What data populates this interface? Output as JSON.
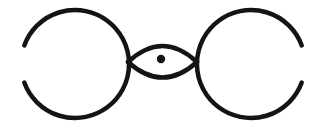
{
  "figure": {
    "canvas": {
      "width": 329,
      "height": 133,
      "background_color": "#ffffff"
    },
    "ink": {
      "color": "#141414",
      "stroke_width": 4.5,
      "style": "hand-drawn"
    },
    "shapes": [
      {
        "name": "left-circle-arc",
        "type": "arc",
        "center_x": 75,
        "center_y": 64,
        "radius": 54,
        "start_angle_deg": 200,
        "end_angle_deg": 160,
        "gap_side": "left",
        "path": "M 24.3 45.5 A 54 54 0 1 1 24.3 82.5"
      },
      {
        "name": "right-circle-arc",
        "type": "arc",
        "center_x": 251,
        "center_y": 64,
        "radius": 54,
        "start_angle_deg": 20,
        "end_angle_deg": 340,
        "gap_side": "right",
        "path": "M 301.7 82.5 A 54 54 0 1 1 301.7 45.5"
      },
      {
        "name": "eye-upper-arc",
        "type": "arc",
        "start_x": 128,
        "start_y": 62,
        "end_x": 197,
        "end_y": 62,
        "apex_y": 41,
        "path": "M 128 62 Q 162.5 30 197 62"
      },
      {
        "name": "eye-lower-arc",
        "type": "arc",
        "start_x": 128,
        "start_y": 62,
        "end_x": 197,
        "end_y": 62,
        "apex_y": 80,
        "path": "M 128 62 Q 162.5 93 197 62"
      },
      {
        "name": "pupil-dot",
        "type": "circle",
        "center_x": 161,
        "center_y": 59,
        "radius": 4.2,
        "filled": true
      }
    ],
    "intersections": [
      {
        "name": "left-crossing",
        "x": 128,
        "y": 62
      },
      {
        "name": "right-crossing",
        "x": 197,
        "y": 62
      }
    ]
  }
}
